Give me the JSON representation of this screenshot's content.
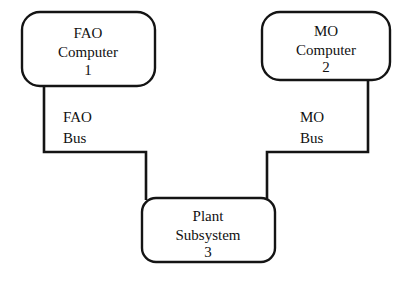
{
  "diagram": {
    "type": "block-diagram",
    "background_color": "#ffffff",
    "line_color": "#141414",
    "text_color": "#111111",
    "nodes": [
      {
        "id": "fao-computer",
        "name": "FAO Computer",
        "line1": "FAO",
        "line2": "Computer",
        "number": "1",
        "x": 22,
        "y": 12,
        "width": 133,
        "height": 74,
        "corner_radius": 18
      },
      {
        "id": "mo-computer",
        "name": "MO Computer",
        "line1": "MO",
        "line2": "Computer",
        "number": "2",
        "x": 262,
        "y": 12,
        "width": 128,
        "height": 68,
        "corner_radius": 18
      },
      {
        "id": "plant-subsystem",
        "name": "Plant Subsystem",
        "line1": "Plant",
        "line2": "Subsystem",
        "number": "3",
        "x": 142,
        "y": 198,
        "width": 133,
        "height": 64,
        "corner_radius": 14
      }
    ],
    "connections": [
      {
        "id": "fao-bus",
        "name": "FAO Bus",
        "label_line1": "FAO",
        "label_line2": "Bus",
        "label_x": 63,
        "label_y1": 122,
        "label_y2": 143,
        "path": "M 44 86 L 44 152 L 146 152 L 146 200",
        "from": "fao-computer",
        "to": "plant-subsystem"
      },
      {
        "id": "mo-bus",
        "name": "MO Bus",
        "label_line1": "MO",
        "label_line2": "Bus",
        "label_x": 300,
        "label_y1": 122,
        "label_y2": 143,
        "path": "M 368 80 L 368 152 L 267 152 L 267 200",
        "from": "mo-computer",
        "to": "plant-subsystem"
      }
    ]
  }
}
